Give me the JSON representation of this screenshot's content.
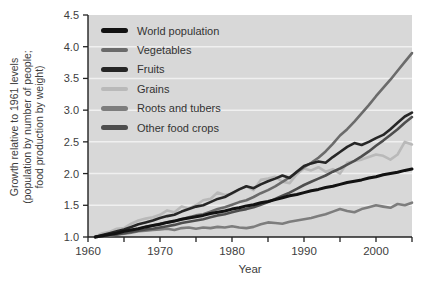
{
  "figure": {
    "background_color": "#ffffff",
    "plot_background_color": "#d8d8d8",
    "gridline_color": "#f0f0f0",
    "axis_color": "#222222",
    "tick_label_color": "#3d3d3d"
  },
  "chart_data": {
    "type": "line",
    "title": "",
    "xlabel": "Year",
    "ylabel": "Growth relative to 1961 levels (population by number of people; food production by weight)",
    "ylabel_lines": [
      "Growth relative to 1961 levels",
      "(population by number of people;",
      "food production by weight)"
    ],
    "xlim": [
      1960,
      2005
    ],
    "ylim": [
      1.0,
      4.5
    ],
    "x_ticks_major": [
      1960,
      1970,
      1980,
      1990,
      2000
    ],
    "x_ticks_minor": [
      1965,
      1975,
      1985,
      1995,
      2005
    ],
    "y_ticks": [
      1.0,
      1.5,
      2.0,
      2.5,
      3.0,
      3.5,
      4.0,
      4.5
    ],
    "grid": "horizontal white lines at 0.5 intervals",
    "legend_position": "top-left inside plot area",
    "x": [
      1961,
      1962,
      1963,
      1964,
      1965,
      1966,
      1967,
      1968,
      1969,
      1970,
      1971,
      1972,
      1973,
      1974,
      1975,
      1976,
      1977,
      1978,
      1979,
      1980,
      1981,
      1982,
      1983,
      1984,
      1985,
      1986,
      1987,
      1988,
      1989,
      1990,
      1991,
      1992,
      1993,
      1994,
      1995,
      1996,
      1997,
      1998,
      1999,
      2000,
      2001,
      2002,
      2003,
      2004,
      2005
    ],
    "series": [
      {
        "name": "World population",
        "color": "#121212",
        "line_width": 3,
        "values": [
          1.0,
          1.02,
          1.04,
          1.06,
          1.09,
          1.11,
          1.13,
          1.16,
          1.18,
          1.2,
          1.23,
          1.25,
          1.28,
          1.3,
          1.32,
          1.34,
          1.37,
          1.39,
          1.41,
          1.44,
          1.46,
          1.49,
          1.51,
          1.54,
          1.56,
          1.59,
          1.62,
          1.65,
          1.67,
          1.7,
          1.73,
          1.75,
          1.78,
          1.8,
          1.83,
          1.86,
          1.88,
          1.9,
          1.93,
          1.95,
          1.98,
          2.0,
          2.02,
          2.05,
          2.07
        ]
      },
      {
        "name": "Vegetables",
        "color": "#6b6b6b",
        "line_width": 2.6,
        "values": [
          1.0,
          1.02,
          1.05,
          1.07,
          1.09,
          1.11,
          1.13,
          1.16,
          1.18,
          1.21,
          1.23,
          1.25,
          1.28,
          1.31,
          1.34,
          1.36,
          1.4,
          1.44,
          1.47,
          1.51,
          1.55,
          1.58,
          1.63,
          1.69,
          1.74,
          1.8,
          1.87,
          1.94,
          2.02,
          2.1,
          2.17,
          2.25,
          2.35,
          2.47,
          2.6,
          2.7,
          2.82,
          2.95,
          3.08,
          3.22,
          3.35,
          3.48,
          3.62,
          3.76,
          3.9
        ]
      },
      {
        "name": "Fruits",
        "color": "#262626",
        "line_width": 2.6,
        "values": [
          1.0,
          1.03,
          1.06,
          1.09,
          1.12,
          1.16,
          1.2,
          1.23,
          1.26,
          1.3,
          1.33,
          1.35,
          1.4,
          1.44,
          1.48,
          1.5,
          1.55,
          1.6,
          1.63,
          1.69,
          1.75,
          1.8,
          1.77,
          1.83,
          1.88,
          1.92,
          1.97,
          1.93,
          2.03,
          2.12,
          2.16,
          2.19,
          2.17,
          2.26,
          2.34,
          2.42,
          2.48,
          2.45,
          2.5,
          2.56,
          2.61,
          2.7,
          2.8,
          2.9,
          2.96
        ]
      },
      {
        "name": "Grains",
        "color": "#b9b9b9",
        "line_width": 2.6,
        "values": [
          1.0,
          1.06,
          1.08,
          1.13,
          1.14,
          1.21,
          1.26,
          1.29,
          1.31,
          1.35,
          1.42,
          1.39,
          1.48,
          1.45,
          1.5,
          1.58,
          1.6,
          1.7,
          1.66,
          1.68,
          1.75,
          1.8,
          1.74,
          1.9,
          1.92,
          1.95,
          1.87,
          1.85,
          1.99,
          2.08,
          2.05,
          2.1,
          2.03,
          2.07,
          2.0,
          2.17,
          2.2,
          2.22,
          2.26,
          2.3,
          2.28,
          2.22,
          2.3,
          2.5,
          2.46
        ]
      },
      {
        "name": "Roots and tubers",
        "color": "#7d7d7d",
        "line_width": 2.6,
        "values": [
          1.0,
          1.01,
          1.02,
          1.04,
          1.05,
          1.07,
          1.09,
          1.1,
          1.11,
          1.12,
          1.13,
          1.11,
          1.14,
          1.15,
          1.13,
          1.15,
          1.14,
          1.16,
          1.15,
          1.17,
          1.15,
          1.14,
          1.16,
          1.2,
          1.23,
          1.22,
          1.21,
          1.24,
          1.26,
          1.28,
          1.3,
          1.33,
          1.36,
          1.4,
          1.44,
          1.41,
          1.39,
          1.44,
          1.47,
          1.5,
          1.48,
          1.46,
          1.52,
          1.5,
          1.54
        ]
      },
      {
        "name": "Other food crops",
        "color": "#4e4e4e",
        "line_width": 2.6,
        "values": [
          1.0,
          1.01,
          1.03,
          1.04,
          1.06,
          1.08,
          1.1,
          1.12,
          1.13,
          1.15,
          1.17,
          1.19,
          1.22,
          1.24,
          1.26,
          1.28,
          1.31,
          1.34,
          1.36,
          1.39,
          1.42,
          1.44,
          1.47,
          1.51,
          1.55,
          1.6,
          1.65,
          1.7,
          1.76,
          1.82,
          1.87,
          1.92,
          1.97,
          2.03,
          2.08,
          2.14,
          2.2,
          2.27,
          2.35,
          2.44,
          2.52,
          2.61,
          2.7,
          2.8,
          2.89
        ]
      }
    ]
  }
}
